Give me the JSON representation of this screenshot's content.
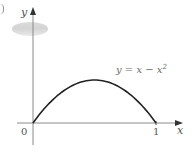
{
  "chart_data": {
    "type": "line",
    "title": "",
    "xlabel": "x",
    "ylabel": "y",
    "x_ticks": [
      "0",
      "1"
    ],
    "y_ticks": [],
    "xlim": [
      0,
      1.2
    ],
    "ylim": [
      0,
      0.67
    ],
    "grid": false,
    "legend": null,
    "annotations": [
      {
        "text": "y = x − x²",
        "x": 0.7,
        "y": 0.3
      }
    ],
    "series": [
      {
        "name": "y = x − x^2",
        "x": [
          0,
          0.1,
          0.2,
          0.3,
          0.4,
          0.5,
          0.6,
          0.7,
          0.8,
          0.9,
          1.0
        ],
        "values": [
          0,
          0.09,
          0.16,
          0.21,
          0.24,
          0.25,
          0.24,
          0.21,
          0.16,
          0.09,
          0
        ]
      }
    ]
  },
  "labels": {
    "y_axis": "y",
    "x_axis": "x",
    "origin": "0",
    "x_tick_1": "1",
    "equation_main": "y = x − x",
    "equation_exp": "2"
  },
  "colors": {
    "curve": "#222222",
    "axis": "#8a8a8a",
    "arrow": "#333333"
  }
}
